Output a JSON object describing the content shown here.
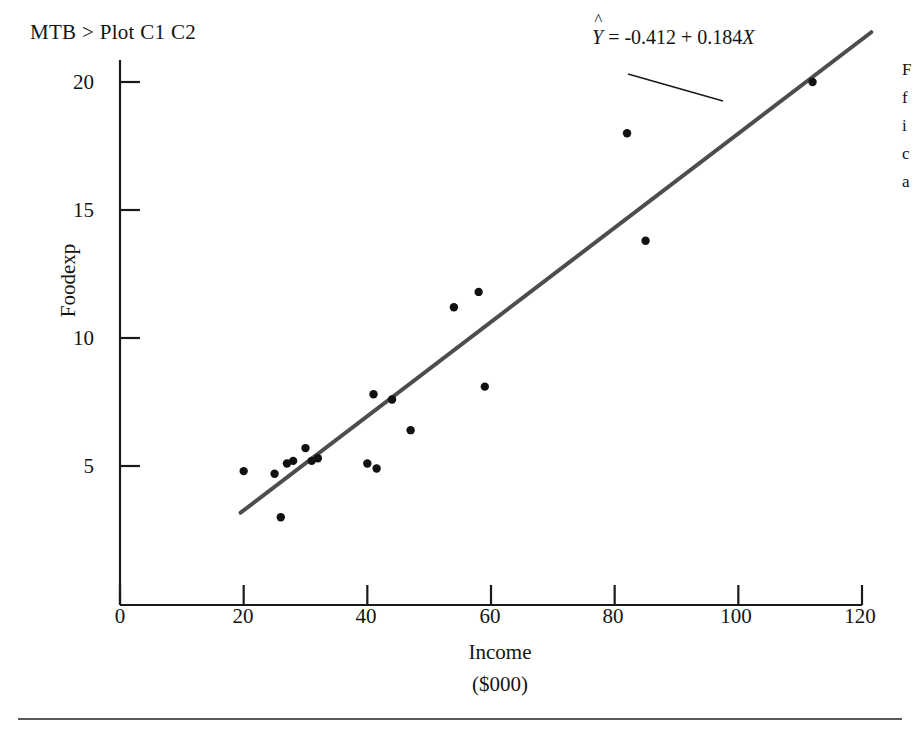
{
  "command_prompt": "MTB > Plot C1  C2",
  "equation": {
    "hat": "^",
    "lhs": "Y",
    "rest": " = -0.412 + 0.184",
    "xvar": "X",
    "full": "Ŷ = -0.412 + 0.184X"
  },
  "side_note_lines": [
    "F",
    "f",
    "i",
    "c",
    "a"
  ],
  "chart_data": {
    "type": "scatter",
    "title": "",
    "subtitle": "",
    "xlabel": "Income",
    "xlabel2": "($000)",
    "ylabel": "Foodexp",
    "xlim": [
      0,
      120
    ],
    "ylim": [
      0,
      21.5
    ],
    "xticks": [
      0,
      20,
      40,
      60,
      80,
      100,
      120
    ],
    "xtick_labels": [
      "0",
      "20",
      "40",
      "60",
      "80",
      "100",
      "120"
    ],
    "yticks": [
      5,
      10,
      15,
      20
    ],
    "ytick_labels": [
      "5",
      "10",
      "15",
      "20"
    ],
    "grid": false,
    "legend": null,
    "x": [
      20,
      25,
      26,
      27,
      28,
      30,
      31,
      32,
      40,
      41,
      41.5,
      44,
      47,
      54,
      58,
      59,
      82,
      85,
      112
    ],
    "y": [
      4.8,
      4.7,
      3.0,
      5.1,
      5.2,
      5.7,
      5.2,
      5.3,
      5.1,
      7.8,
      4.9,
      7.6,
      6.4,
      11.2,
      11.8,
      8.1,
      18.0,
      13.8,
      20.0
    ],
    "points": [
      {
        "x": 20,
        "y": 4.8
      },
      {
        "x": 25,
        "y": 4.7
      },
      {
        "x": 26,
        "y": 3.0
      },
      {
        "x": 27,
        "y": 5.1
      },
      {
        "x": 28,
        "y": 5.2
      },
      {
        "x": 30,
        "y": 5.7
      },
      {
        "x": 31,
        "y": 5.2
      },
      {
        "x": 32,
        "y": 5.3
      },
      {
        "x": 40,
        "y": 5.1
      },
      {
        "x": 41,
        "y": 7.8
      },
      {
        "x": 41.5,
        "y": 4.9
      },
      {
        "x": 44,
        "y": 7.6
      },
      {
        "x": 47,
        "y": 6.4
      },
      {
        "x": 54,
        "y": 11.2
      },
      {
        "x": 58,
        "y": 11.8
      },
      {
        "x": 59,
        "y": 8.1
      },
      {
        "x": 82,
        "y": 18.0
      },
      {
        "x": 85,
        "y": 13.8
      },
      {
        "x": 112,
        "y": 20.0
      }
    ],
    "fit_line": {
      "intercept": -0.412,
      "slope": 0.184,
      "x_start": 19.5,
      "x_end": 121.5,
      "label": "Ŷ = -0.412 + 0.184X",
      "color": "#4d4d4d"
    },
    "marker_color": "#111111",
    "axis_color": "#1a1a1a"
  }
}
